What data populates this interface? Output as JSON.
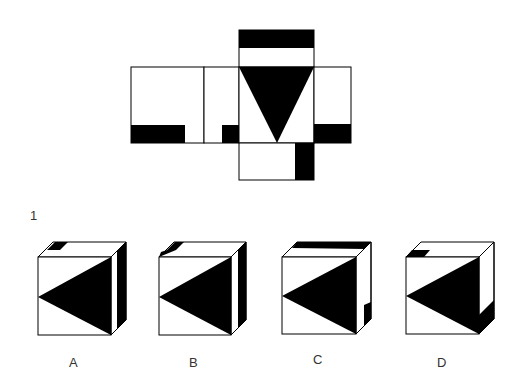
{
  "question": {
    "number": "1",
    "prompt_net": "cube net",
    "options": [
      {
        "label": "A"
      },
      {
        "label": "B"
      },
      {
        "label": "C"
      },
      {
        "label": "D"
      }
    ]
  },
  "colors": {
    "ink": "#000000",
    "paper": "#ffffff"
  }
}
